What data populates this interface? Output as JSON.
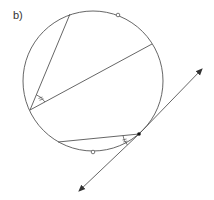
{
  "figure": {
    "label": "b)"
  },
  "diagram": {
    "circle": {
      "cx": 93,
      "cy": 81,
      "r": 70
    },
    "chords": [
      {
        "name": "chord-top-left",
        "x1": 30,
        "y1": 110,
        "x2": 70,
        "y2": 14
      },
      {
        "name": "chord-diameter-like",
        "x1": 30,
        "y1": 110,
        "x2": 152,
        "y2": 44
      },
      {
        "name": "chord-bottom",
        "x1": 58,
        "y1": 142,
        "x2": 139,
        "y2": 134
      }
    ],
    "tangent": {
      "x1": 77,
      "y1": 193,
      "x2": 204,
      "y2": 67,
      "point": {
        "x": 139,
        "y": 134
      }
    },
    "open_points": [
      {
        "x": 118,
        "y": 15
      },
      {
        "x": 93,
        "y": 152
      }
    ],
    "angle_marks": [
      {
        "name": "inscribed-angle-mark",
        "vertex": {
          "x": 30,
          "y": 110
        },
        "ticks": 2
      },
      {
        "name": "tangent-chord-angle-mark",
        "vertex": {
          "x": 139,
          "y": 134
        },
        "ticks": 2
      }
    ],
    "colors": {
      "stroke": "#555555",
      "point": "#111111"
    }
  }
}
